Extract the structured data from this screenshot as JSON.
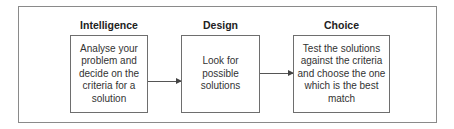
{
  "stages": [
    {
      "heading": "Intelligence",
      "text": "Analyse your problem and decide on the criteria for a solution"
    },
    {
      "heading": "Design",
      "text": "Look for possible solutions"
    },
    {
      "heading": "Choice",
      "text": "Test the solutions against the criteria and choose the one which is the best match"
    }
  ],
  "colors": {
    "border": "#6e6e6e",
    "text": "#333333",
    "background": "#ffffff"
  }
}
